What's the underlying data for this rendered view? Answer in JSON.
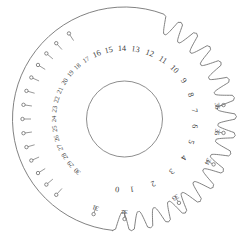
{
  "figure": {
    "name": "winding-index-disc",
    "line_color": "#6b6b6b",
    "number_color": "#3a3a3a",
    "background": "#ffffff"
  },
  "geometry": {
    "center_x": 124.5,
    "center_y": 119.0,
    "hub_radius": 38.0,
    "inner_label_radius": 70.0,
    "outer_label_radius": 93.0,
    "disc_radius": 112.0,
    "notch_count": 37
  },
  "hub": {
    "label": "center-hole",
    "radius": 38.0
  },
  "slot_numbers": {
    "description": "Large keyhole slot graduations, inner label ring",
    "values": [
      "0",
      "1",
      "2",
      "3",
      "4",
      "5",
      "6",
      "7",
      "8",
      "9",
      "10",
      "11",
      "12",
      "13",
      "14",
      "15",
      "16",
      "17",
      "18",
      "19",
      "20",
      "21",
      "22",
      "23",
      "24",
      "25",
      "26",
      "27",
      "28",
      "29",
      "30"
    ]
  },
  "pin_numbers": {
    "description": "Small pin-hole graduations, outer label ring",
    "values": [
      "31",
      "32",
      "33",
      "34",
      "35",
      "36"
    ]
  },
  "all_graduations": [
    {
      "n": "0",
      "angle": 96,
      "ring": "inner",
      "notch": "slot"
    },
    {
      "n": "1",
      "angle": 84,
      "ring": "inner",
      "notch": "slot"
    },
    {
      "n": "2",
      "angle": 66,
      "ring": "inner",
      "notch": "slot"
    },
    {
      "n": "3",
      "angle": 48,
      "ring": "inner",
      "notch": "slot"
    },
    {
      "n": "4",
      "angle": 33,
      "ring": "inner",
      "notch": "slot"
    },
    {
      "n": "5",
      "angle": 19,
      "ring": "inner",
      "notch": "slot"
    },
    {
      "n": "6",
      "angle": 6,
      "ring": "inner",
      "notch": "slot"
    },
    {
      "n": "7",
      "angle": -7,
      "ring": "inner",
      "notch": "slot"
    },
    {
      "n": "8",
      "angle": -20,
      "ring": "inner",
      "notch": "slot"
    },
    {
      "n": "9",
      "angle": -33,
      "ring": "inner",
      "notch": "slot"
    },
    {
      "n": "10",
      "angle": -45,
      "ring": "inner",
      "notch": "slot"
    },
    {
      "n": "11",
      "angle": -57,
      "ring": "inner",
      "notch": "slot"
    },
    {
      "n": "12",
      "angle": -69,
      "ring": "inner",
      "notch": "slot"
    },
    {
      "n": "13",
      "angle": -81,
      "ring": "inner",
      "notch": "slot"
    },
    {
      "n": "14",
      "angle": -92,
      "ring": "inner",
      "notch": "slot"
    },
    {
      "n": "15",
      "angle": -103,
      "ring": "inner",
      "notch": "slot"
    },
    {
      "n": "16",
      "angle": -113,
      "ring": "inner",
      "notch": "slot"
    },
    {
      "n": "17",
      "angle": -123,
      "ring": "inner",
      "notch": "pin"
    },
    {
      "n": "18",
      "angle": -132,
      "ring": "inner",
      "notch": "pin"
    },
    {
      "n": "19",
      "angle": -140,
      "ring": "inner",
      "notch": "pin"
    },
    {
      "n": "20",
      "angle": -148,
      "ring": "inner",
      "notch": "pin"
    },
    {
      "n": "21",
      "angle": -156,
      "ring": "inner",
      "notch": "pin"
    },
    {
      "n": "22",
      "angle": -164,
      "ring": "inner",
      "notch": "pin"
    },
    {
      "n": "23",
      "angle": -172,
      "ring": "inner",
      "notch": "pin"
    },
    {
      "n": "24",
      "angle": -180,
      "ring": "inner",
      "notch": "pin"
    },
    {
      "n": "25",
      "angle": -188,
      "ring": "inner",
      "notch": "pin"
    },
    {
      "n": "26",
      "angle": -196,
      "ring": "inner",
      "notch": "pin"
    },
    {
      "n": "27",
      "angle": -204,
      "ring": "inner",
      "notch": "pin"
    },
    {
      "n": "28",
      "angle": -212,
      "ring": "inner",
      "notch": "pin"
    },
    {
      "n": "29",
      "angle": -220,
      "ring": "inner",
      "notch": "pin"
    },
    {
      "n": "30",
      "angle": -228,
      "ring": "inner",
      "notch": "pin"
    },
    {
      "n": "31",
      "angle": 108,
      "ring": "outer",
      "notch": "pin"
    },
    {
      "n": "32",
      "angle": 90,
      "ring": "outer",
      "notch": "pin"
    },
    {
      "n": "33",
      "angle": 57,
      "ring": "outer",
      "notch": "pin"
    },
    {
      "n": "34",
      "angle": 27,
      "ring": "outer",
      "notch": "pin"
    },
    {
      "n": "35",
      "angle": 8,
      "ring": "outer",
      "notch": "pin"
    },
    {
      "n": "36",
      "angle": -8,
      "ring": "outer",
      "notch": "pin"
    }
  ]
}
